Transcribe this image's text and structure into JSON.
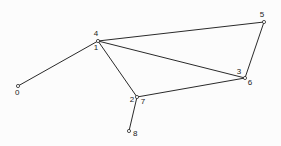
{
  "figure": {
    "kind": "node-link-graph",
    "background_color": "#fcfcfc",
    "line_color": "#2a2a2a",
    "label_color": "#1a1a1a",
    "width": 281,
    "height": 146
  },
  "graph": {
    "nodes": [
      {
        "id": "0",
        "label": "0",
        "x": 18,
        "y": 86,
        "label_x": 15,
        "label_y": 95,
        "label_anchor": "start"
      },
      {
        "id": "4",
        "label": "4",
        "x": 98,
        "y": 41,
        "label_x": 96,
        "label_y": 36,
        "label_anchor": "middle"
      },
      {
        "id": "1",
        "label": "1",
        "x": 98,
        "y": 41,
        "label_x": 96,
        "label_y": 50,
        "label_anchor": "middle"
      },
      {
        "id": "5",
        "label": "5",
        "x": 264,
        "y": 22,
        "label_x": 262,
        "label_y": 17,
        "label_anchor": "middle"
      },
      {
        "id": "3",
        "label": "3",
        "x": 245,
        "y": 78,
        "label_x": 239,
        "label_y": 74,
        "label_anchor": "middle"
      },
      {
        "id": "6",
        "label": "6",
        "x": 245,
        "y": 78,
        "label_x": 250,
        "label_y": 85,
        "label_anchor": "middle"
      },
      {
        "id": "2",
        "label": "2",
        "x": 137,
        "y": 97,
        "label_x": 132,
        "label_y": 102,
        "label_anchor": "middle"
      },
      {
        "id": "7",
        "label": "7",
        "x": 137,
        "y": 97,
        "label_x": 143,
        "label_y": 104,
        "label_anchor": "middle"
      },
      {
        "id": "8",
        "label": "8",
        "x": 129,
        "y": 131,
        "label_x": 133,
        "label_y": 136,
        "label_anchor": "start"
      }
    ],
    "edges": [
      {
        "from": "0",
        "to": "4",
        "x1": 18,
        "y1": 86,
        "x2": 98,
        "y2": 41
      },
      {
        "from": "4",
        "to": "5",
        "x1": 98,
        "y1": 41,
        "x2": 264,
        "y2": 22
      },
      {
        "from": "1",
        "to": "6",
        "x1": 98,
        "y1": 41,
        "x2": 245,
        "y2": 78
      },
      {
        "from": "1",
        "to": "2",
        "x1": 98,
        "y1": 41,
        "x2": 137,
        "y2": 97
      },
      {
        "from": "5",
        "to": "6",
        "x1": 264,
        "y1": 22,
        "x2": 245,
        "y2": 78
      },
      {
        "from": "7",
        "to": "3",
        "x1": 137,
        "y1": 97,
        "x2": 245,
        "y2": 78
      },
      {
        "from": "7",
        "to": "8",
        "x1": 137,
        "y1": 97,
        "x2": 129,
        "y2": 131
      }
    ]
  }
}
